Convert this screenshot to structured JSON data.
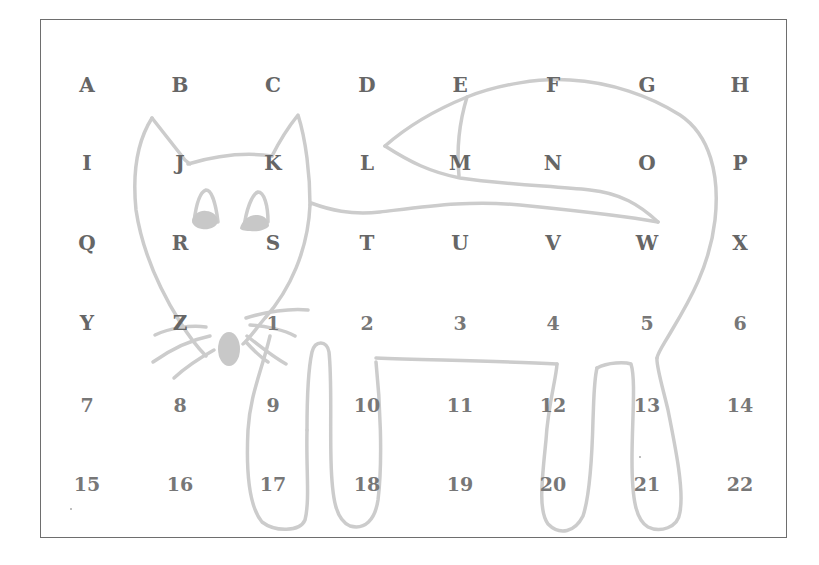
{
  "grid": {
    "columns_x": [
      87,
      180,
      273,
      367,
      460,
      553,
      647,
      740
    ],
    "rows_y": [
      85,
      163,
      243,
      323,
      405,
      484
    ],
    "rows": [
      [
        "A",
        "B",
        "C",
        "D",
        "E",
        "F",
        "G",
        "H"
      ],
      [
        "I",
        "J",
        "K",
        "L",
        "M",
        "N",
        "O",
        "P"
      ],
      [
        "Q",
        "R",
        "S",
        "T",
        "U",
        "V",
        "W",
        "X"
      ],
      [
        "Y",
        "Z",
        "1",
        "2",
        "3",
        "4",
        "5",
        "6"
      ],
      [
        "7",
        "8",
        "9",
        "10",
        "11",
        "12",
        "13",
        "14"
      ],
      [
        "15",
        "16",
        "17",
        "18",
        "19",
        "20",
        "21",
        "22"
      ]
    ]
  },
  "drawing": {
    "subject": "cat-outline",
    "stroke_color": "#cccccc",
    "fill_color": "#c8c8c8",
    "text_color": "#666666",
    "frame_color": "#6e6e6e"
  }
}
